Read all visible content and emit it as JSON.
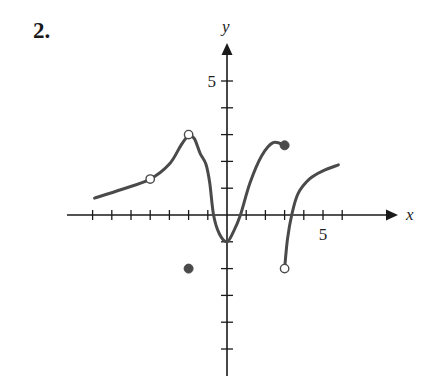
{
  "problem": {
    "number_label": "2."
  },
  "chart_data": {
    "type": "line",
    "title": "",
    "xlabel": "x",
    "ylabel": "y",
    "xlim": [
      -8,
      9
    ],
    "ylim": [
      -6,
      6
    ],
    "x_ticks": [
      -7,
      -6,
      -5,
      -4,
      -3,
      -2,
      -1,
      1,
      2,
      3,
      4,
      5,
      6
    ],
    "y_ticks": [
      -5,
      -4,
      -3,
      -2,
      -1,
      1,
      2,
      3,
      4,
      5
    ],
    "x_tick_labels": [
      {
        "value": 5,
        "label": "5"
      }
    ],
    "y_tick_labels": [
      {
        "value": 5,
        "label": "5"
      }
    ],
    "grid": false,
    "curve_color": "#4a4a4a",
    "axis_color": "#1a1a1a",
    "series": [
      {
        "name": "piece-1-left",
        "points": [
          [
            -6.9,
            0.63
          ],
          [
            -5.5,
            0.95
          ],
          [
            -4,
            1.34
          ],
          [
            -3,
            1.9
          ],
          [
            -2.4,
            2.6
          ],
          [
            -2,
            3
          ]
        ]
      },
      {
        "name": "piece-2-center",
        "points": [
          [
            -2,
            3
          ],
          [
            -1.7,
            2.85
          ],
          [
            -1.4,
            2.3
          ],
          [
            -1.1,
            1.9
          ],
          [
            -0.9,
            1.2
          ],
          [
            -0.7,
            0
          ],
          [
            -0.4,
            -0.7
          ],
          [
            0,
            -1
          ],
          [
            0.35,
            -0.6
          ],
          [
            0.7,
            0
          ],
          [
            1.2,
            1.2
          ],
          [
            1.8,
            2.2
          ],
          [
            2.4,
            2.7
          ],
          [
            3,
            2.6
          ]
        ]
      },
      {
        "name": "piece-3-right",
        "points": [
          [
            3,
            -2
          ],
          [
            3.15,
            -0.9
          ],
          [
            3.37,
            0
          ],
          [
            3.7,
            0.8
          ],
          [
            4.3,
            1.35
          ],
          [
            5,
            1.65
          ],
          [
            5.8,
            1.87
          ]
        ]
      }
    ],
    "markers": [
      {
        "x": -4,
        "y": 1.34,
        "style": "open"
      },
      {
        "x": -2,
        "y": 3,
        "style": "open"
      },
      {
        "x": -2,
        "y": -2,
        "style": "filled"
      },
      {
        "x": 3,
        "y": 2.6,
        "style": "filled"
      },
      {
        "x": 3,
        "y": -2,
        "style": "open"
      }
    ],
    "layout": {
      "origin_px": [
        227,
        215
      ],
      "unit_x_px": 19.2,
      "unit_y_px": 26.8,
      "x_axis_px": [
        67,
        398
      ],
      "y_axis_px": [
        43,
        376
      ]
    }
  }
}
